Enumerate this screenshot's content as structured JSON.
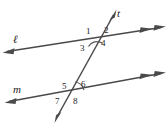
{
  "figure": {
    "kind": "geometry-diagram",
    "background_color": "#ffffff",
    "stroke_color": "#3a3a3a",
    "label_color": "#1b1b1b"
  },
  "lines": [
    {
      "id": "line-l",
      "name": "ℓ",
      "role": "parallel-line-upper",
      "left_arrowheads": 1,
      "right_arrowheads": 2
    },
    {
      "id": "line-m",
      "name": "m",
      "role": "parallel-line-lower",
      "left_arrowheads": 1,
      "right_arrowheads": 2
    },
    {
      "id": "line-t",
      "name": "t",
      "role": "transversal",
      "top_arrowheads": 1,
      "bottom_arrowheads": 1
    }
  ],
  "angles": {
    "upper_intersection": [
      {
        "id": "angle-1",
        "label": "1",
        "position": "upper-left"
      },
      {
        "id": "angle-2",
        "label": "2",
        "position": "upper-right"
      },
      {
        "id": "angle-3",
        "label": "3",
        "position": "lower-left"
      },
      {
        "id": "angle-4",
        "label": "4",
        "position": "lower-right"
      }
    ],
    "lower_intersection": [
      {
        "id": "angle-5",
        "label": "5",
        "position": "upper-left"
      },
      {
        "id": "angle-6",
        "label": "6",
        "position": "upper-right"
      },
      {
        "id": "angle-7",
        "label": "7",
        "position": "lower-left"
      },
      {
        "id": "angle-8",
        "label": "8",
        "position": "lower-right"
      }
    ]
  },
  "arc_marks": [
    {
      "id": "arc-upper",
      "at": "upper-intersection",
      "spans": "angle-3-to-angle-4"
    },
    {
      "id": "arc-lower",
      "at": "lower-intersection",
      "spans": "angle-6"
    }
  ]
}
